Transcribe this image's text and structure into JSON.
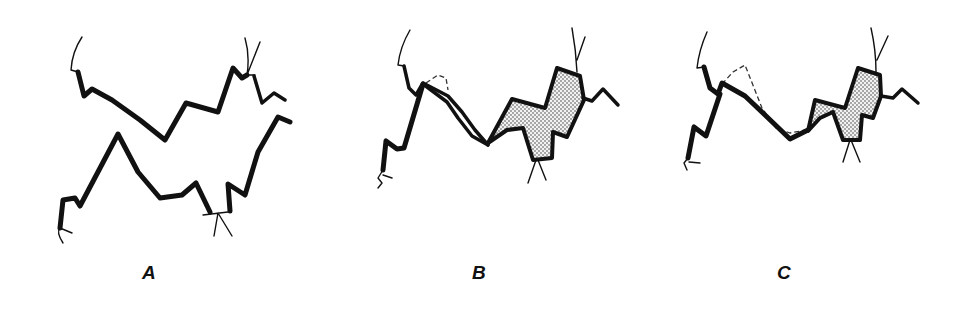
{
  "figure": {
    "panels": [
      {
        "id": "A",
        "label": "A",
        "description": "Two separated wavy boundary lines (upper and lower) with forked branch ends"
      },
      {
        "id": "B",
        "label": "B",
        "description": "Lines joined; dashed outline of former position; stippled zone on right"
      },
      {
        "id": "C",
        "label": "C",
        "description": "Lines joined; larger dashed outline of former position; smaller stippled zone on right"
      }
    ],
    "colors": {
      "line": "#111111",
      "background": "#ffffff",
      "stipple": "#222222"
    }
  }
}
